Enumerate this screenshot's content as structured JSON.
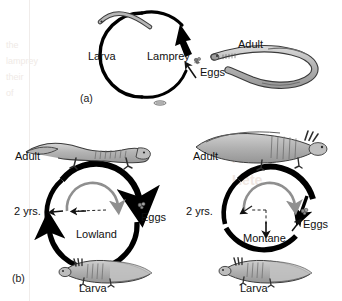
{
  "figure": {
    "title_hidden": "Life cycle diagrams",
    "panels": [
      {
        "id": "(a)",
        "cycle_label": "Lamprey",
        "stages": [
          "Larva",
          "Adult",
          "Eggs"
        ]
      },
      {
        "id": "(b)",
        "cycles": [
          {
            "cycle_label": "Lowland",
            "duration_label": "2 yrs.",
            "stages": [
              "Adult",
              "Eggs",
              "Larva"
            ]
          },
          {
            "cycle_label": "Montane",
            "duration_label": "2 yrs.",
            "stages": [
              "Adult",
              "Eggs",
              "Larva"
            ]
          }
        ]
      }
    ]
  },
  "panel_a": {
    "id": "(a)",
    "center_label": "Lamprey",
    "larva_label": "Larva",
    "adult_label": "Adult",
    "eggs_label": "Eggs",
    "icons": {
      "larva": "lamprey-larva-icon",
      "adult": "adult-lamprey-icon",
      "eggs": "egg-cluster-icon",
      "small_mark": "small-egg-mark-icon"
    }
  },
  "panel_b": {
    "id": "(b)",
    "left": {
      "center_label": "Lowland",
      "duration_label": "2 yrs.",
      "adult_label": "Adult",
      "eggs_label": "Eggs",
      "larva_label": "Larva",
      "icons": {
        "adult": "terrestrial-salamander-icon",
        "larva": "gilled-larva-icon",
        "eggs": "egg-cluster-icon"
      }
    },
    "right": {
      "center_label": "Montane",
      "duration_label": "2 yrs.",
      "adult_label": "Adult",
      "eggs_label": "Eggs",
      "larva_label": "Larva",
      "icons": {
        "adult": "paedomorphic-gilled-salamander-icon",
        "larva": "gilled-larva-icon",
        "eggs": "egg-cluster-icon"
      }
    }
  },
  "colors": {
    "ink": "#101010",
    "cycle_arrow": "#000000",
    "inner_arc": "#8a8a8a",
    "animal_fill": "#b9b9b9",
    "animal_outline": "#3a3a3a",
    "page": "#ffffff"
  }
}
